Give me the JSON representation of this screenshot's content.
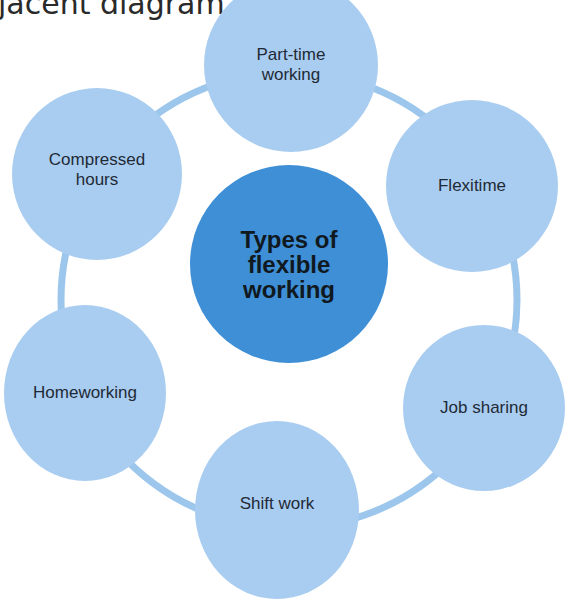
{
  "intro_text": "jacent diagram.",
  "diagram": {
    "center": {
      "label": "Types of flexible working"
    },
    "nodes": [
      {
        "id": "part-time",
        "label": "Part-time working"
      },
      {
        "id": "flexitime",
        "label": "Flexitime"
      },
      {
        "id": "job-sharing",
        "label": "Job sharing"
      },
      {
        "id": "shift-work",
        "label": "Shift work"
      },
      {
        "id": "homeworking",
        "label": "Homeworking"
      },
      {
        "id": "compressed-hours",
        "label": "Compressed hours"
      }
    ],
    "colors": {
      "center_fill": "#3f8fd6",
      "node_fill": "#a9cdf0",
      "ring_stroke": "#9cc6ec"
    }
  }
}
